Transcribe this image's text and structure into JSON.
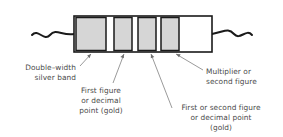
{
  "figure": {
    "type": "component-diagram",
    "component": "resistor",
    "canvas": {
      "width": 283,
      "height": 137
    },
    "background_color": "#ffffff",
    "line_color": "#1a1a1a",
    "text_color": "#4a4a4a",
    "leader_color": "#6e6e6e"
  },
  "resistor": {
    "body": {
      "x": 74,
      "y": 16,
      "width": 138,
      "height": 36,
      "fill": "#ffffff",
      "stroke": "#1a1a1a"
    },
    "leads": {
      "left_label": "left-lead-wire",
      "right_label": "right-lead-wire",
      "style": "wavy"
    },
    "bands": [
      {
        "id": "band-1",
        "name": "double-width-silver-band",
        "x": 76,
        "width": 30,
        "fill": "#d6d6d6",
        "double_width": true
      },
      {
        "id": "band-2",
        "name": "first-figure-band-gold",
        "x": 114,
        "width": 18,
        "fill": "#d6d6d6",
        "double_width": false
      },
      {
        "id": "band-3",
        "name": "figure-band-gold-a",
        "x": 138,
        "width": 18,
        "fill": "#d6d6d6",
        "double_width": false
      },
      {
        "id": "band-4",
        "name": "figure-band-gold-b",
        "x": 161,
        "width": 18,
        "fill": "#d6d6d6",
        "double_width": false
      }
    ],
    "blank_tail": {
      "name": "uncoloured-body-end",
      "x": 181,
      "width": 29,
      "fill": "#ffffff"
    }
  },
  "callouts": [
    {
      "id": "callout-silver",
      "name": "callout-double-width-silver-band",
      "lines": [
        "Double–width",
        "silver band"
      ],
      "align": "end",
      "text_x": 76,
      "text_y": 70,
      "line_height": 10,
      "leader": {
        "x1": 80,
        "y1": 66,
        "x2": 91,
        "y2": 54
      },
      "points_to_band": "band-1"
    },
    {
      "id": "callout-first-figure",
      "name": "callout-first-figure-or-decimal-point-gold",
      "lines": [
        "First figure",
        "or decimal",
        "point (gold)"
      ],
      "align": "middle",
      "text_x": 101,
      "text_y": 93,
      "line_height": 10,
      "leader": {
        "x1": 113,
        "y1": 83,
        "x2": 124,
        "y2": 55
      },
      "points_to_band": "band-2"
    },
    {
      "id": "callout-first-or-second",
      "name": "callout-first-or-second-figure-or-decimal-point-gold",
      "lines": [
        "First or second figure",
        "or decimal point",
        "(gold)"
      ],
      "align": "middle",
      "text_x": 221,
      "text_y": 110,
      "line_height": 10,
      "leader": {
        "x1": 172,
        "y1": 108,
        "x2": 151,
        "y2": 55
      },
      "points_to_band": "band-3"
    },
    {
      "id": "callout-multiplier",
      "name": "callout-multiplier-or-second-figure",
      "lines": [
        "Multiplier or",
        "second figure"
      ],
      "align": "start",
      "text_x": 206,
      "text_y": 74,
      "line_height": 10,
      "leader": {
        "x1": 203,
        "y1": 70,
        "x2": 176,
        "y2": 55
      },
      "points_to_band": "band-4"
    }
  ]
}
